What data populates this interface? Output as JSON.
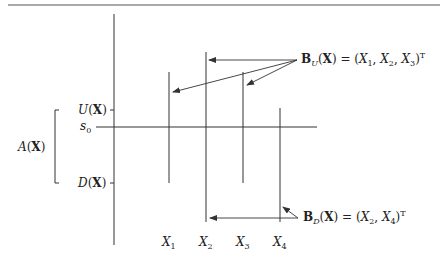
{
  "diagram": {
    "colors": {
      "line": "#333333",
      "rule": "#555555",
      "text": "#222222",
      "background": "#ffffff"
    },
    "axis_labels": {
      "U": {
        "fn": "U",
        "arg": "X"
      },
      "s0": {
        "base": "s",
        "sub": "0"
      },
      "D": {
        "fn": "D",
        "arg": "X"
      },
      "A": {
        "fn": "A",
        "arg": "X"
      }
    },
    "variables": [
      {
        "base": "X",
        "sub": "1"
      },
      {
        "base": "X",
        "sub": "2"
      },
      {
        "base": "X",
        "sub": "3"
      },
      {
        "base": "X",
        "sub": "4"
      }
    ],
    "annotations": {
      "BU": {
        "bold": "B",
        "sub": "U",
        "arg": "X",
        "eq": " = (",
        "terms": [
          "X",
          "1",
          ", ",
          "X",
          "2",
          ", ",
          "X",
          "3"
        ],
        "close": ")",
        "sup": "T",
        "text": "B_U(X) = (X1, X2, X3)^T"
      },
      "BD": {
        "bold": "B",
        "sub": "D",
        "arg": "X",
        "eq": " = (",
        "close": ")",
        "sup": "T",
        "text": "B_D(X) = (X2, X4)^T"
      }
    },
    "geometry": {
      "main_axis_x": 114,
      "s0_y": 127,
      "U_y": 110,
      "D_y": 183,
      "vertical_lines": [
        {
          "name": "X1",
          "x": 169,
          "y1": 72,
          "y2": 183
        },
        {
          "name": "X2",
          "x": 206,
          "y1": 52,
          "y2": 222
        },
        {
          "name": "X3",
          "x": 243,
          "y1": 72,
          "y2": 183
        },
        {
          "name": "X4",
          "x": 280,
          "y1": 108,
          "y2": 222
        }
      ]
    }
  }
}
